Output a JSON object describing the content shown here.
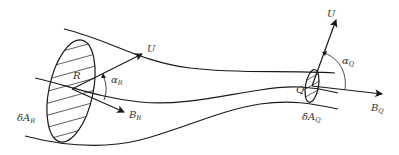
{
  "diagram": {
    "type": "flux tube with cross-sections",
    "labels": {
      "U_R": "U",
      "U_Q": "U",
      "R": "R",
      "Q": "Q",
      "alpha_R": "α",
      "alpha_R_sub": "R",
      "alpha_Q": "α",
      "alpha_Q_sub": "Q",
      "B_R": "B",
      "B_R_sub": "R",
      "B_Q": "B",
      "B_Q_sub": "Q",
      "dA_R": "δA",
      "dA_R_sub": "R",
      "dA_Q": "δA",
      "dA_Q_sub": "Q"
    },
    "colors": {
      "stroke": "#1a1a1a",
      "text": "#333333",
      "background": "#ffffff"
    }
  }
}
